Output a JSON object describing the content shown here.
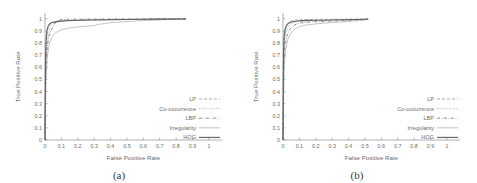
{
  "figure": {
    "panels": [
      {
        "caption": "(a)",
        "xlabel": "False Positive Rate",
        "ylabel": "True Positive Rate"
      },
      {
        "caption": "(b)",
        "xlabel": "False Positive Rate",
        "ylabel": "True Positive Rate"
      }
    ],
    "legend": [
      {
        "label": "LP",
        "style": "dotted"
      },
      {
        "label": "Co-occurrence",
        "style": "fine-dotted"
      },
      {
        "label": "LBP",
        "style": "dash-dot"
      },
      {
        "label": "Irregularity",
        "style": "thin-solid"
      },
      {
        "label": "HOG",
        "style": "thick-solid"
      }
    ]
  },
  "chart_data": [
    {
      "type": "line",
      "title": "(a)",
      "xlabel": "False Positive Rate",
      "ylabel": "True Positive Rate",
      "xlim": [
        0,
        1.08
      ],
      "ylim": [
        0,
        1.04
      ],
      "xticks": [
        "0",
        "0.1",
        "0.2",
        "0.3",
        "0.4",
        "0.5",
        "0.6",
        "0.7",
        "0.8",
        "0.9",
        "1"
      ],
      "yticks": [
        "0",
        "0.1",
        "0.2",
        "0.3",
        "0.4",
        "0.5",
        "0.6",
        "0.7",
        "0.8",
        "0.9",
        "1"
      ],
      "grid": false,
      "legend_position": "lower-right",
      "series": [
        {
          "name": "LP",
          "x": [
            0,
            0.004,
            0.008,
            0.012,
            0.02,
            0.03,
            0.045,
            0.06,
            0.08,
            0.1,
            0.13,
            0.17,
            0.22,
            0.3,
            0.4,
            0.5,
            0.62,
            0.72,
            0.82,
            0.86
          ],
          "y": [
            0,
            0.62,
            0.8,
            0.88,
            0.93,
            0.955,
            0.968,
            0.975,
            0.979,
            0.982,
            0.985,
            0.987,
            0.989,
            0.991,
            0.993,
            0.995,
            0.996,
            0.998,
            0.999,
            1.0
          ]
        },
        {
          "name": "Co-occurrence",
          "x": [
            0,
            0.004,
            0.01,
            0.018,
            0.028,
            0.04,
            0.055,
            0.075,
            0.1,
            0.13,
            0.18,
            0.24,
            0.32,
            0.42,
            0.52,
            0.64,
            0.74,
            0.84,
            0.86
          ],
          "y": [
            0,
            0.58,
            0.76,
            0.86,
            0.915,
            0.945,
            0.962,
            0.972,
            0.978,
            0.982,
            0.985,
            0.988,
            0.99,
            0.992,
            0.994,
            0.996,
            0.998,
            0.999,
            1.0
          ]
        },
        {
          "name": "LBP",
          "x": [
            0,
            0.005,
            0.012,
            0.022,
            0.035,
            0.05,
            0.062,
            0.075,
            0.09,
            0.11,
            0.135,
            0.16,
            0.2,
            0.26,
            0.34,
            0.44,
            0.56,
            0.68,
            0.8,
            0.86
          ],
          "y": [
            0,
            0.55,
            0.74,
            0.845,
            0.9,
            0.935,
            0.968,
            0.985,
            0.992,
            0.995,
            0.996,
            0.997,
            0.997,
            0.998,
            0.998,
            0.999,
            0.999,
            1.0,
            1.0,
            1.0
          ]
        },
        {
          "name": "Irregularity",
          "x": [
            0,
            0.006,
            0.015,
            0.028,
            0.045,
            0.065,
            0.09,
            0.115,
            0.15,
            0.19,
            0.24,
            0.3,
            0.33,
            0.4,
            0.5,
            0.6,
            0.72,
            0.84,
            0.86
          ],
          "y": [
            0,
            0.5,
            0.7,
            0.8,
            0.855,
            0.885,
            0.905,
            0.915,
            0.925,
            0.932,
            0.938,
            0.944,
            0.955,
            0.968,
            0.978,
            0.986,
            0.993,
            0.999,
            1.0
          ]
        },
        {
          "name": "HOG",
          "x": [
            0,
            0.003,
            0.007,
            0.012,
            0.018,
            0.026,
            0.036,
            0.05,
            0.07,
            0.095,
            0.125,
            0.16,
            0.21,
            0.28,
            0.37,
            0.48,
            0.6,
            0.72,
            0.83,
            0.86
          ],
          "y": [
            0,
            0.66,
            0.83,
            0.9,
            0.935,
            0.955,
            0.966,
            0.972,
            0.977,
            0.981,
            0.984,
            0.986,
            0.988,
            0.991,
            0.993,
            0.995,
            0.997,
            0.998,
            0.999,
            1.0
          ]
        }
      ]
    },
    {
      "type": "line",
      "title": "(b)",
      "xlabel": "False Positive Rate",
      "ylabel": "True Positive Rate",
      "xlim": [
        0,
        1.08
      ],
      "ylim": [
        0,
        1.04
      ],
      "xticks": [
        "0",
        "0.1",
        "0.2",
        "0.3",
        "0.4",
        "0.5",
        "0.6",
        "0.7",
        "0.8",
        "0.9",
        "1"
      ],
      "yticks": [
        "0",
        "0.1",
        "0.2",
        "0.3",
        "0.4",
        "0.5",
        "0.6",
        "0.7",
        "0.8",
        "0.9",
        "1"
      ],
      "grid": false,
      "legend_position": "lower-right",
      "series": [
        {
          "name": "LP",
          "x": [
            0,
            0.003,
            0.008,
            0.016,
            0.026,
            0.04,
            0.055,
            0.075,
            0.1,
            0.14,
            0.2,
            0.28,
            0.36,
            0.44,
            0.5,
            0.52
          ],
          "y": [
            0,
            0.7,
            0.84,
            0.92,
            0.955,
            0.975,
            0.985,
            0.99,
            0.992,
            0.994,
            0.995,
            0.996,
            0.997,
            0.998,
            0.999,
            1.0
          ]
        },
        {
          "name": "Co-occurrence",
          "x": [
            0,
            0.004,
            0.01,
            0.02,
            0.032,
            0.048,
            0.07,
            0.095,
            0.13,
            0.18,
            0.24,
            0.31,
            0.38,
            0.45,
            0.5,
            0.52
          ],
          "y": [
            0,
            0.66,
            0.81,
            0.895,
            0.935,
            0.958,
            0.97,
            0.977,
            0.981,
            0.984,
            0.986,
            0.989,
            0.991,
            0.993,
            0.995,
            0.997
          ]
        },
        {
          "name": "LBP",
          "x": [
            0,
            0.005,
            0.013,
            0.025,
            0.04,
            0.058,
            0.08,
            0.105,
            0.14,
            0.19,
            0.25,
            0.32,
            0.39,
            0.46,
            0.5,
            0.52
          ],
          "y": [
            0,
            0.62,
            0.78,
            0.865,
            0.912,
            0.94,
            0.956,
            0.965,
            0.971,
            0.975,
            0.979,
            0.983,
            0.987,
            0.991,
            0.994,
            0.996
          ]
        },
        {
          "name": "Irregularity",
          "x": [
            0,
            0.006,
            0.016,
            0.03,
            0.05,
            0.072,
            0.1,
            0.13,
            0.17,
            0.22,
            0.28,
            0.34,
            0.4,
            0.46,
            0.5,
            0.52
          ],
          "y": [
            0,
            0.58,
            0.74,
            0.835,
            0.885,
            0.915,
            0.935,
            0.946,
            0.954,
            0.961,
            0.967,
            0.973,
            0.979,
            0.986,
            0.992,
            0.995
          ]
        },
        {
          "name": "HOG",
          "x": [
            0,
            0.003,
            0.007,
            0.013,
            0.021,
            0.032,
            0.046,
            0.065,
            0.09,
            0.12,
            0.16,
            0.21,
            0.28,
            0.36,
            0.44,
            0.5,
            0.52
          ],
          "y": [
            0,
            0.72,
            0.855,
            0.915,
            0.945,
            0.962,
            0.972,
            0.978,
            0.982,
            0.985,
            0.987,
            0.989,
            0.991,
            0.993,
            0.995,
            0.997,
            0.998
          ]
        }
      ]
    }
  ]
}
